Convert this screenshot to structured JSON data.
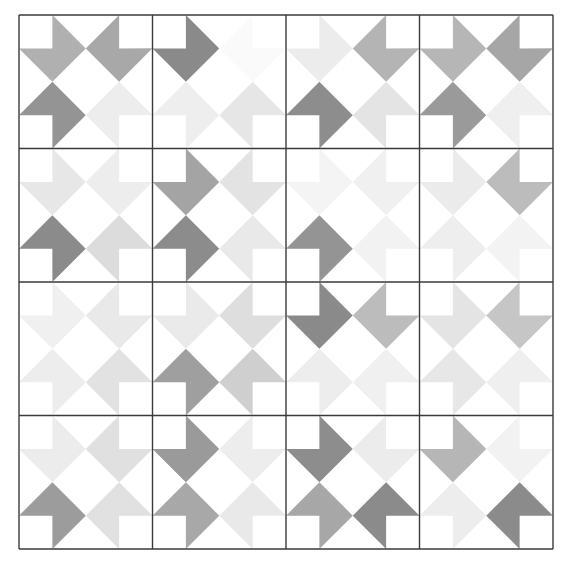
{
  "artwork": {
    "title": "Grayscale Pinwheel Dart Quilt Pattern",
    "type": "geometric-quilt-grid",
    "canvas_width": 568,
    "canvas_height": 564,
    "background_color": "#ffffff",
    "grid": {
      "rows": 4,
      "cols": 4,
      "origin_x": 19,
      "origin_y": 15,
      "block_size": 133.5,
      "quarter_size": 66.75,
      "grid_line_color": "#3a3a3a",
      "grid_line_width": 1.4,
      "outer_border": true
    },
    "palette": {
      "white": "#ffffff",
      "very_light": "#f2f2f2",
      "light": "#e8e8e8",
      "light_mid": "#dcdcdc",
      "mid": "#c9c9c9",
      "mid_gray": "#b0b0b0",
      "gray": "#a0a0a0",
      "dark_gray": "#8a8a8a",
      "darkest": "#7a7a7a"
    },
    "shape": {
      "name": "concave-dart",
      "description": "Unit square with diamond outline and a square notch removed at the center-facing quadrant",
      "polygon_normalized": [
        [
          0.5,
          0
        ],
        [
          1,
          0.5
        ],
        [
          0.5,
          1
        ],
        [
          0,
          0.5
        ],
        [
          0.5,
          0.5
        ]
      ],
      "orientations": [
        "0",
        "90",
        "180",
        "270"
      ]
    },
    "block_orientation_pattern": {
      "description": "Each block contains four darts in pinwheel rotation",
      "top_left": 0,
      "top_right": 90,
      "bottom_right": 180,
      "bottom_left": 270
    },
    "blocks": [
      {
        "row": 0,
        "col": 0,
        "quarters": [
          {
            "pos": "tl",
            "rotation": 0,
            "color": "#b0b0b0"
          },
          {
            "pos": "tr",
            "rotation": 90,
            "color": "#a8a8a8"
          },
          {
            "pos": "br",
            "rotation": 180,
            "color": "#ededed"
          },
          {
            "pos": "bl",
            "rotation": 270,
            "color": "#949494"
          }
        ]
      },
      {
        "row": 0,
        "col": 1,
        "quarters": [
          {
            "pos": "tl",
            "rotation": 0,
            "color": "#8a8a8a"
          },
          {
            "pos": "tr",
            "rotation": 90,
            "color": "#fafafa"
          },
          {
            "pos": "br",
            "rotation": 180,
            "color": "#e6e6e6"
          },
          {
            "pos": "bl",
            "rotation": 270,
            "color": "#eeeeee"
          }
        ]
      },
      {
        "row": 0,
        "col": 2,
        "quarters": [
          {
            "pos": "tl",
            "rotation": 0,
            "color": "#ececec"
          },
          {
            "pos": "tr",
            "rotation": 90,
            "color": "#b4b4b4"
          },
          {
            "pos": "br",
            "rotation": 180,
            "color": "#e4e4e4"
          },
          {
            "pos": "bl",
            "rotation": 270,
            "color": "#8d8d8d"
          }
        ]
      },
      {
        "row": 0,
        "col": 3,
        "quarters": [
          {
            "pos": "tl",
            "rotation": 0,
            "color": "#b6b6b6"
          },
          {
            "pos": "tr",
            "rotation": 90,
            "color": "#a6a6a6"
          },
          {
            "pos": "br",
            "rotation": 180,
            "color": "#efefef"
          },
          {
            "pos": "bl",
            "rotation": 270,
            "color": "#9a9a9a"
          }
        ]
      },
      {
        "row": 1,
        "col": 0,
        "quarters": [
          {
            "pos": "tl",
            "rotation": 0,
            "color": "#e7e7e7"
          },
          {
            "pos": "tr",
            "rotation": 90,
            "color": "#ededed"
          },
          {
            "pos": "br",
            "rotation": 180,
            "color": "#dcdcdc"
          },
          {
            "pos": "bl",
            "rotation": 270,
            "color": "#8b8b8b"
          }
        ]
      },
      {
        "row": 1,
        "col": 1,
        "quarters": [
          {
            "pos": "tl",
            "rotation": 0,
            "color": "#a4a4a4"
          },
          {
            "pos": "tr",
            "rotation": 90,
            "color": "#e3e3e3"
          },
          {
            "pos": "br",
            "rotation": 180,
            "color": "#e9e9e9"
          },
          {
            "pos": "bl",
            "rotation": 270,
            "color": "#8c8c8c"
          }
        ]
      },
      {
        "row": 1,
        "col": 2,
        "quarters": [
          {
            "pos": "tl",
            "rotation": 0,
            "color": "#f4f4f4"
          },
          {
            "pos": "tr",
            "rotation": 90,
            "color": "#f0f0f0"
          },
          {
            "pos": "br",
            "rotation": 180,
            "color": "#f2f2f2"
          },
          {
            "pos": "bl",
            "rotation": 270,
            "color": "#949494"
          }
        ]
      },
      {
        "row": 1,
        "col": 3,
        "quarters": [
          {
            "pos": "tl",
            "rotation": 0,
            "color": "#ebebeb"
          },
          {
            "pos": "tr",
            "rotation": 90,
            "color": "#bcbcbc"
          },
          {
            "pos": "br",
            "rotation": 180,
            "color": "#f3f3f3"
          },
          {
            "pos": "bl",
            "rotation": 270,
            "color": "#eeeeee"
          }
        ]
      },
      {
        "row": 2,
        "col": 0,
        "quarters": [
          {
            "pos": "tl",
            "rotation": 0,
            "color": "#f0f0f0"
          },
          {
            "pos": "tr",
            "rotation": 90,
            "color": "#e9e9e9"
          },
          {
            "pos": "br",
            "rotation": 180,
            "color": "#e2e2e2"
          },
          {
            "pos": "bl",
            "rotation": 270,
            "color": "#ededed"
          }
        ]
      },
      {
        "row": 2,
        "col": 1,
        "quarters": [
          {
            "pos": "tl",
            "rotation": 0,
            "color": "#eaeaea"
          },
          {
            "pos": "tr",
            "rotation": 90,
            "color": "#dedede"
          },
          {
            "pos": "br",
            "rotation": 180,
            "color": "#cfcfcf"
          },
          {
            "pos": "bl",
            "rotation": 270,
            "color": "#9f9f9f"
          }
        ]
      },
      {
        "row": 2,
        "col": 2,
        "quarters": [
          {
            "pos": "tl",
            "rotation": 0,
            "color": "#8a8a8a"
          },
          {
            "pos": "tr",
            "rotation": 90,
            "color": "#bcbcbc"
          },
          {
            "pos": "br",
            "rotation": 180,
            "color": "#f0f0f0"
          },
          {
            "pos": "bl",
            "rotation": 270,
            "color": "#ededed"
          }
        ]
      },
      {
        "row": 2,
        "col": 3,
        "quarters": [
          {
            "pos": "tl",
            "rotation": 0,
            "color": "#e4e4e4"
          },
          {
            "pos": "tr",
            "rotation": 90,
            "color": "#c6c6c6"
          },
          {
            "pos": "br",
            "rotation": 180,
            "color": "#efefef"
          },
          {
            "pos": "bl",
            "rotation": 270,
            "color": "#e7e7e7"
          }
        ]
      },
      {
        "row": 3,
        "col": 0,
        "quarters": [
          {
            "pos": "tl",
            "rotation": 0,
            "color": "#ececec"
          },
          {
            "pos": "tr",
            "rotation": 90,
            "color": "#e0e0e0"
          },
          {
            "pos": "br",
            "rotation": 180,
            "color": "#e1e1e1"
          },
          {
            "pos": "bl",
            "rotation": 270,
            "color": "#9c9c9c"
          }
        ]
      },
      {
        "row": 3,
        "col": 1,
        "quarters": [
          {
            "pos": "tl",
            "rotation": 0,
            "color": "#9a9a9a"
          },
          {
            "pos": "tr",
            "rotation": 90,
            "color": "#ededed"
          },
          {
            "pos": "br",
            "rotation": 180,
            "color": "#e9e9e9"
          },
          {
            "pos": "bl",
            "rotation": 270,
            "color": "#a8a8a8"
          }
        ]
      },
      {
        "row": 3,
        "col": 2,
        "quarters": [
          {
            "pos": "tl",
            "rotation": 0,
            "color": "#8d8d8d"
          },
          {
            "pos": "tr",
            "rotation": 90,
            "color": "#ececec"
          },
          {
            "pos": "br",
            "rotation": 180,
            "color": "#8b8b8b"
          },
          {
            "pos": "bl",
            "rotation": 270,
            "color": "#a7a7a7"
          }
        ]
      },
      {
        "row": 3,
        "col": 3,
        "quarters": [
          {
            "pos": "tl",
            "rotation": 0,
            "color": "#b6b6b6"
          },
          {
            "pos": "tr",
            "rotation": 90,
            "color": "#f2f2f2"
          },
          {
            "pos": "br",
            "rotation": 180,
            "color": "#8b8b8b"
          },
          {
            "pos": "bl",
            "rotation": 270,
            "color": "#ededed"
          }
        ]
      }
    ]
  }
}
